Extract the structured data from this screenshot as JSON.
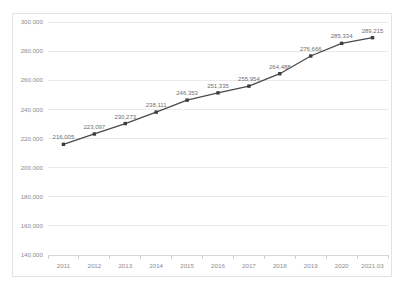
{
  "chart_data": {
    "type": "line",
    "title": "",
    "title_visible_fragment": "(title clipped at top edge of image)",
    "xlabel": "",
    "ylabel": "",
    "categories": [
      "2011",
      "2012",
      "2013",
      "2014",
      "2015",
      "2016",
      "2017",
      "2018",
      "2019",
      "2020",
      "2021.03"
    ],
    "values": [
      216005,
      223097,
      230273,
      238111,
      246353,
      251335,
      255954,
      264488,
      276666,
      285334,
      289215
    ],
    "data_labels": [
      "216,005",
      "223,097",
      "230,273",
      "238,111",
      "246,353",
      "251,335",
      "255,954",
      "264,488",
      "276,666",
      "285,334",
      "289,215"
    ],
    "ylim": [
      140000,
      300000
    ],
    "yticks": [
      140000,
      160000,
      180000,
      200000,
      220000,
      240000,
      260000,
      280000,
      300000
    ],
    "ytick_labels": [
      "140,000",
      "160,000",
      "180,000",
      "200,000",
      "220,000",
      "240,000",
      "260,000",
      "280,000",
      "300,000"
    ],
    "grid": true,
    "grid_axis": "y",
    "legend": false,
    "markers": true,
    "series": [
      {
        "name": "",
        "values": [
          216005,
          223097,
          230273,
          238111,
          246353,
          251335,
          255954,
          264488,
          276666,
          285334,
          289215
        ]
      }
    ]
  },
  "colors": {
    "line": "#4a4a4a",
    "marker": "#3d3d3d",
    "grid": "#e9e9ec",
    "axis": "#d6d6da",
    "frame": "#e3e3e6",
    "tick_text": "#8d8d92",
    "label_text": "#6f6f74",
    "background": "#ffffff"
  }
}
